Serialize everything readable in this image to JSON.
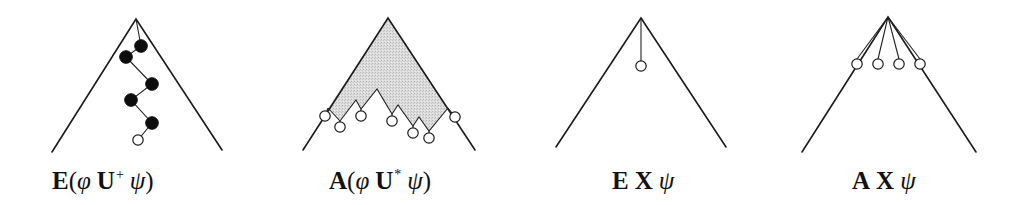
{
  "figure": {
    "colors": {
      "line": "#1a1a1a",
      "filled_node": "#0d0d0d",
      "open_node_fill": "#ffffff",
      "shading": "#d9d9d9"
    },
    "panels": [
      {
        "id": "EU_plus",
        "label": {
          "quantifier": "E",
          "open_paren": "(",
          "left_var": "φ",
          "operator": "U",
          "superscript": "+",
          "right_var": "ψ",
          "close_paren": ")"
        },
        "apex": [
          136,
          19
        ],
        "bottom_left": [
          52,
          152
        ],
        "bottom_right": [
          222,
          150
        ],
        "path_nodes_filled": [
          [
            141,
            46
          ],
          [
            126,
            57
          ],
          [
            152,
            84
          ],
          [
            131,
            100
          ],
          [
            152,
            123
          ]
        ],
        "end_node_open": [
          138,
          140
        ]
      },
      {
        "id": "AU_star",
        "label": {
          "quantifier": "A",
          "open_paren": "(",
          "left_var": "φ",
          "operator": "U",
          "superscript": "*",
          "right_var": "ψ",
          "close_paren": ")"
        },
        "apex": [
          388,
          18
        ],
        "bottom_left": [
          303,
          150
        ],
        "bottom_right": [
          475,
          150
        ],
        "shaded_frontier": [
          [
            328,
            108
          ],
          [
            340,
            121
          ],
          [
            356,
            100
          ],
          [
            361,
            109
          ],
          [
            377,
            89
          ],
          [
            392,
            114
          ],
          [
            398,
            105
          ],
          [
            413,
            126
          ],
          [
            419,
            117
          ],
          [
            429,
            131
          ],
          [
            448,
            108
          ]
        ],
        "open_nodes": [
          [
            325,
            116
          ],
          [
            340,
            127
          ],
          [
            361,
            116
          ],
          [
            392,
            121
          ],
          [
            413,
            133
          ],
          [
            429,
            138
          ],
          [
            455,
            117
          ]
        ]
      },
      {
        "id": "EX",
        "label": {
          "quantifier": "E",
          "operator": "X",
          "right_var": "ψ"
        },
        "apex": [
          641,
          18
        ],
        "bottom_left": [
          556,
          147
        ],
        "bottom_right": [
          726,
          147
        ],
        "open_nodes": [
          [
            641,
            66
          ]
        ]
      },
      {
        "id": "AX",
        "label": {
          "quantifier": "A",
          "operator": "X",
          "right_var": "ψ"
        },
        "apex": [
          888,
          17
        ],
        "bottom_left": [
          802,
          152
        ],
        "bottom_right": [
          976,
          152
        ],
        "open_nodes": [
          [
            857,
            64
          ],
          [
            878,
            64
          ],
          [
            899,
            64
          ],
          [
            920,
            64
          ]
        ]
      }
    ]
  }
}
